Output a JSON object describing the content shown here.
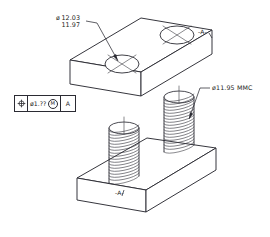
{
  "drawing": {
    "title": "isometric-threaded-stud-plate-assembly",
    "background_color": "#ffffff",
    "line_color": "#2b2b33"
  },
  "dimensions": {
    "diameter_symbol": "ø",
    "upper_limit": "12.03",
    "lower_limit": "11.97"
  },
  "notes": {
    "mmc_note": "ø11.95 MMC"
  },
  "datums": {
    "top_label": "-A-",
    "bottom_label": "-A-"
  },
  "feature_control_frame": {
    "symbol_name": "position-symbol",
    "tolerance_value": "ø1.??",
    "material_modifier": "M",
    "datum_reference": "A"
  },
  "geometry": {
    "top_plate": "rectangular-plate-with-two-clearance-holes",
    "bottom_plate": "rectangular-base-plate",
    "studs": [
      {
        "name": "stud-left",
        "thread_turns": 17
      },
      {
        "name": "stud-right",
        "thread_turns": 17
      }
    ],
    "holes": [
      {
        "name": "hole-left"
      },
      {
        "name": "hole-right"
      }
    ]
  }
}
